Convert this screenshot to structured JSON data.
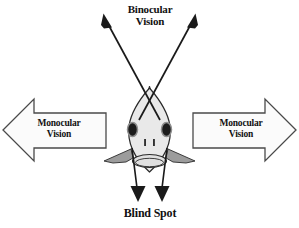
{
  "figure": {
    "title_text": "Fish visual field diagram",
    "background_color": "#ffffff",
    "ink_color": "#111111"
  },
  "labels": {
    "binocular": "Binocular\nVision",
    "blind_spot": "Blind Spot",
    "monocular_left": "Monocular\nVision",
    "monocular_right": "Monocular\nVision"
  },
  "colors": {
    "outline": "#1a1a1a",
    "head_fill": "#e9e9e9",
    "fin_fill": "#9c9c9c",
    "eye_fill": "#1c1c1c",
    "eye_ring": "#8f8f8f",
    "arrow_fill": "#fbfbfb",
    "arrow_stroke": "#4a4a4a",
    "snout_fill": "#a8a8a8",
    "mouth_fill": "#e0e0e0"
  },
  "diagram": {
    "type": "annotated-illustration",
    "fields_of_view": [
      {
        "name": "Binocular Vision",
        "direction": "forward",
        "indicator": "two diverging line arrows pointing up-left and up-right",
        "label_position": "top-center"
      },
      {
        "name": "Monocular Vision",
        "direction": "left lateral",
        "indicator": "left-pointing block arrow",
        "label_position": "left"
      },
      {
        "name": "Monocular Vision",
        "direction": "right lateral",
        "indicator": "right-pointing block arrow",
        "label_position": "right"
      },
      {
        "name": "Blind Spot",
        "direction": "rearward",
        "indicator": "two parallel line arrows pointing down",
        "label_position": "bottom-center"
      }
    ]
  }
}
